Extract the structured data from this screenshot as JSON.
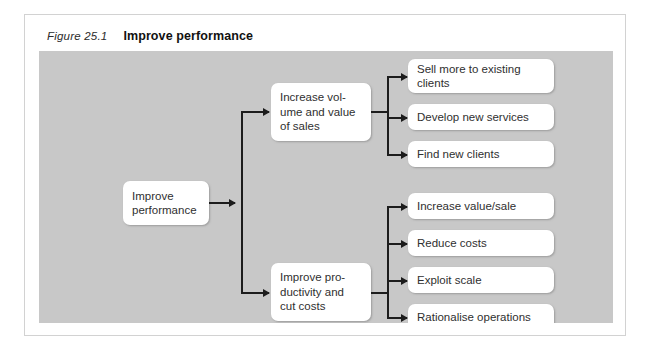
{
  "figure": {
    "number": "Figure 25.1",
    "title": "Improve performance"
  },
  "colors": {
    "panel_background": "#c8c8c8",
    "frame_border": "#d2d2d2",
    "node_background": "#ffffff",
    "connector": "#1c1c1c",
    "text": "#2f2f2f"
  },
  "diagram": {
    "type": "tree",
    "root": {
      "label": "Improve\nperformance"
    },
    "branches": [
      {
        "label": "Increase vol-\nume and value\nof sales",
        "leaves": [
          {
            "label": "Sell more to existing\nclients"
          },
          {
            "label": "Develop new services"
          },
          {
            "label": "Find new clients"
          }
        ]
      },
      {
        "label": "Improve pro-\nductivity and\ncut costs",
        "leaves": [
          {
            "label": "Increase value/sale"
          },
          {
            "label": "Reduce costs"
          },
          {
            "label": "Exploit scale"
          },
          {
            "label": "Rationalise operations"
          }
        ]
      }
    ]
  }
}
